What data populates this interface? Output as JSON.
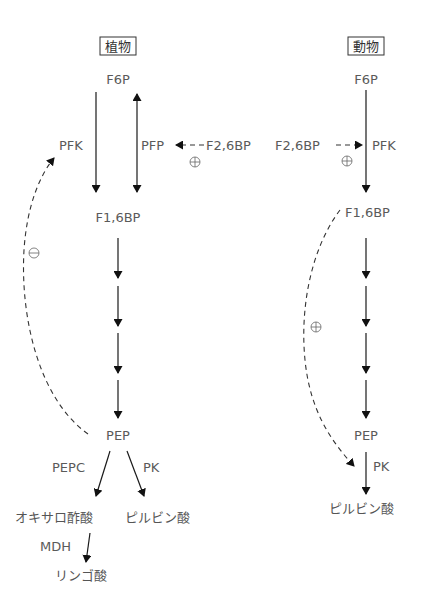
{
  "plant": {
    "header": "植物",
    "f6p": "F6P",
    "pfk": "PFK",
    "pfp": "PFP",
    "f26bp": "F2,6BP",
    "f16bp": "F1,6BP",
    "pep": "PEP",
    "pepc": "PEPC",
    "pk": "PK",
    "oxaloacetate": "オキサロ酢酸",
    "pyruvate": "ピルビン酸",
    "mdh": "MDH",
    "malate": "リンゴ酸",
    "f26bp_effect": "+",
    "pep_feedback_effect": "−"
  },
  "animal": {
    "header": "動物",
    "f6p": "F6P",
    "f26bp": "F2,6BP",
    "pfk": "PFK",
    "f16bp": "F1,6BP",
    "pep": "PEP",
    "pk": "PK",
    "pyruvate": "ピルビン酸",
    "f26bp_effect": "+",
    "f16bp_feedforward_effect": "+"
  }
}
